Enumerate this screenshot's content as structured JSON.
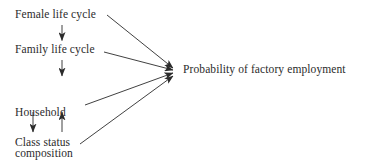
{
  "diagram": {
    "background_color": "#ffffff",
    "ink_color": "#2b2b2b",
    "nodes": {
      "female_life_cycle": "Female life cycle",
      "family_life_cycle": "Family life cycle",
      "household_composition_line1": "Household",
      "household_composition_line2": "composition",
      "class_status": "Class status",
      "outcome": "Probability of factory employment"
    },
    "edges": [
      {
        "id": "female-to-family",
        "from": "Female life cycle",
        "to": "Family life cycle",
        "direction": "down"
      },
      {
        "id": "family-to-household",
        "from": "Family life cycle",
        "to": "Household composition",
        "direction": "down"
      },
      {
        "id": "household-to-class",
        "from": "Household composition",
        "to": "Class status",
        "direction": "down"
      },
      {
        "id": "class-to-household",
        "from": "Class status",
        "to": "Household composition",
        "direction": "up"
      },
      {
        "id": "female-to-outcome",
        "from": "Female life cycle",
        "to": "Probability of factory employment",
        "direction": "diagonal-down-right"
      },
      {
        "id": "family-to-outcome",
        "from": "Family life cycle",
        "to": "Probability of factory employment",
        "direction": "diagonal-down-right"
      },
      {
        "id": "household-to-outcome",
        "from": "Household composition",
        "to": "Probability of factory employment",
        "direction": "diagonal-up-right"
      },
      {
        "id": "class-to-outcome",
        "from": "Class status",
        "to": "Probability of factory employment",
        "direction": "diagonal-up-right"
      }
    ]
  }
}
